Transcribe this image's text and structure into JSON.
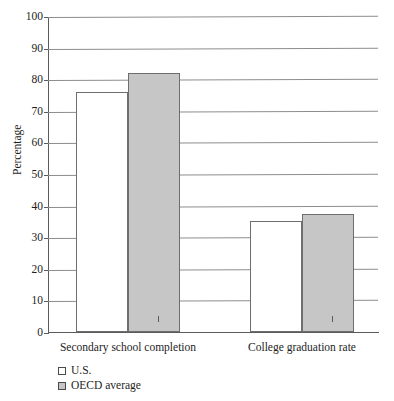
{
  "figure": {
    "top_caption_fragment": "",
    "background_color": "#ffffff",
    "gridline_color": "#8d8d8d",
    "axis_color": "#5b5b5b"
  },
  "legend": {
    "position": "below-plot-left",
    "entries": [
      {
        "label": "U.S.",
        "color": "#ffffff",
        "swatch": "open-square"
      },
      {
        "label": "OECD average",
        "color": "#c6c6c6",
        "swatch": "filled-square"
      }
    ]
  },
  "chart_data": {
    "type": "bar",
    "title": "",
    "subtitle": "",
    "xlabel": "",
    "ylabel": "Percentage",
    "categories": [
      "Secondary school completion",
      "College graduation rate"
    ],
    "series": [
      {
        "name": "U.S.",
        "values": [
          76,
          35
        ],
        "color": "#ffffff"
      },
      {
        "name": "OECD average",
        "values": [
          82,
          37.5
        ],
        "color": "#c6c6c6"
      }
    ],
    "ylim": [
      0,
      100
    ],
    "ytick_values": [
      0,
      10,
      20,
      30,
      40,
      50,
      60,
      70,
      80,
      90,
      100
    ],
    "ytick_labels": [
      "0",
      "10",
      "20",
      "30",
      "40",
      "50",
      "60",
      "70",
      "80",
      "90",
      "100"
    ],
    "grid": true,
    "grid_axis": "y",
    "legend_position": "below",
    "bar_group_gap": true
  }
}
